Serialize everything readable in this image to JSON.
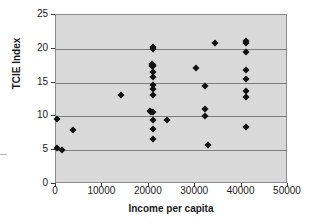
{
  "chart_data": {
    "type": "scatter",
    "title": "",
    "xlabel": "Income per capita",
    "ylabel": "TCIE Index",
    "xlim": [
      0,
      50000
    ],
    "ylim": [
      0,
      25
    ],
    "xticks": [
      0,
      10000,
      20000,
      30000,
      40000,
      50000
    ],
    "xtick_labels": [
      "0",
      "10000",
      "20000",
      "30000",
      "40000",
      "50000"
    ],
    "yticks": [
      0,
      5,
      10,
      15,
      20,
      25
    ],
    "ytick_labels": [
      "0",
      "5",
      "10",
      "15",
      "20",
      "25"
    ],
    "grid": "horizontal",
    "legend": "none",
    "marker": "diamond",
    "marker_color": "#111111",
    "plot_background": "#d9d9d9",
    "points": [
      {
        "x": 300,
        "y": 9.6
      },
      {
        "x": 300,
        "y": 5.3
      },
      {
        "x": 1400,
        "y": 5.0
      },
      {
        "x": 3700,
        "y": 8.0
      },
      {
        "x": 14000,
        "y": 13.1
      },
      {
        "x": 20300,
        "y": 10.8
      },
      {
        "x": 20400,
        "y": 10.6
      },
      {
        "x": 20800,
        "y": 20.2
      },
      {
        "x": 20900,
        "y": 20.0
      },
      {
        "x": 20700,
        "y": 17.8
      },
      {
        "x": 20900,
        "y": 17.6
      },
      {
        "x": 21000,
        "y": 17.5
      },
      {
        "x": 20600,
        "y": 17.4
      },
      {
        "x": 20900,
        "y": 16.5
      },
      {
        "x": 20900,
        "y": 15.8
      },
      {
        "x": 20900,
        "y": 14.6
      },
      {
        "x": 20900,
        "y": 14.1
      },
      {
        "x": 20900,
        "y": 13.1
      },
      {
        "x": 20900,
        "y": 10.7
      },
      {
        "x": 20900,
        "y": 9.4
      },
      {
        "x": 20900,
        "y": 8.2
      },
      {
        "x": 20900,
        "y": 6.7
      },
      {
        "x": 23900,
        "y": 9.5
      },
      {
        "x": 30100,
        "y": 17.2
      },
      {
        "x": 32100,
        "y": 14.5
      },
      {
        "x": 32100,
        "y": 11.1
      },
      {
        "x": 32100,
        "y": 10.1
      },
      {
        "x": 32700,
        "y": 5.8
      },
      {
        "x": 34300,
        "y": 20.8
      },
      {
        "x": 41000,
        "y": 21.2
      },
      {
        "x": 41000,
        "y": 20.9
      },
      {
        "x": 41000,
        "y": 19.6
      },
      {
        "x": 41000,
        "y": 16.8
      },
      {
        "x": 41000,
        "y": 15.6
      },
      {
        "x": 41000,
        "y": 13.8
      },
      {
        "x": 41000,
        "y": 12.9
      },
      {
        "x": 41000,
        "y": 8.5
      }
    ]
  }
}
